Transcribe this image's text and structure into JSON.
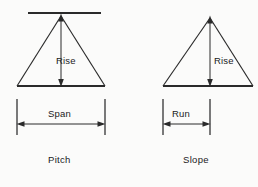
{
  "figure": {
    "title": "",
    "background_color": "#fbfbfa",
    "ink_color": "#2a2a2a",
    "diagrams": [
      {
        "id": "pitch",
        "caption": "Pitch",
        "caption_x": 62,
        "caption_y": 160,
        "vertical_label": "Rise",
        "vertical_label_x": 56,
        "vertical_label_y": 64,
        "horizontal_label": "Span",
        "horizontal_label_x": 61,
        "horizontal_label_y": 115,
        "has_top_reference_line": true,
        "apex": {
          "x": 61,
          "y": 14
        },
        "base_left": {
          "x": 17,
          "y": 86
        },
        "base_right": {
          "x": 105,
          "y": 86
        },
        "top_line": {
          "x1": 28,
          "x2": 101,
          "y": 13
        },
        "dimension": {
          "type": "span",
          "from_x": 17,
          "to_x": 105,
          "arrow_y": 124,
          "ext_top": 99,
          "ext_bottom": 135
        }
      },
      {
        "id": "slope",
        "caption": "Slope",
        "caption_x": 200,
        "caption_y": 160,
        "vertical_label": "Rise",
        "vertical_label_x": 216,
        "vertical_label_y": 64,
        "horizontal_label": "Run",
        "horizontal_label_x": 174,
        "horizontal_label_y": 115,
        "has_top_reference_line": false,
        "apex": {
          "x": 210,
          "y": 16
        },
        "base_left": {
          "x": 163,
          "y": 86
        },
        "base_right": {
          "x": 253,
          "y": 86
        },
        "dimension": {
          "type": "run",
          "from_x": 163,
          "to_x": 210,
          "arrow_y": 124,
          "ext_top": 99,
          "ext_bottom": 135
        }
      }
    ]
  }
}
